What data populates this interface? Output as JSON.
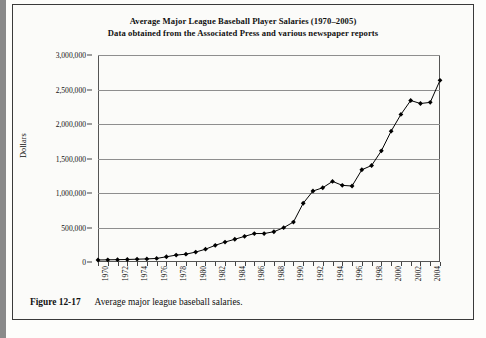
{
  "figure": {
    "caption_label": "Figure 12-17",
    "caption_text": "Average major league baseball salaries."
  },
  "chart_data": {
    "type": "line",
    "title": "Average Major League Baseball Player Salaries (1970–2005)",
    "subtitle": "Data obtained from the Associated Press and various newspaper reports",
    "xlabel": "",
    "ylabel": "Dollars",
    "ylim": [
      0,
      3000000
    ],
    "xlim": [
      1970,
      2005
    ],
    "grid": true,
    "legend": null,
    "ytick_labels": [
      "0",
      "500,000",
      "1,000,000",
      "1,500,000",
      "2,000,000",
      "2,500,000",
      "3,000,000"
    ],
    "ytick_values": [
      0,
      500000,
      1000000,
      1500000,
      2000000,
      2500000,
      3000000
    ],
    "xtick_labels": [
      "1970",
      "1972",
      "1974",
      "1976",
      "1978",
      "1980",
      "1982",
      "1984",
      "1986",
      "1988",
      "1990",
      "1992",
      "1994",
      "1996",
      "1998",
      "2000",
      "2002",
      "2004"
    ],
    "xtick_values": [
      1970,
      1972,
      1974,
      1976,
      1978,
      1980,
      1982,
      1984,
      1986,
      1988,
      1990,
      1992,
      1994,
      1996,
      1998,
      2000,
      2002,
      2004
    ],
    "marker": "diamond",
    "line_color": "#000000",
    "x": [
      1970,
      1971,
      1972,
      1973,
      1974,
      1975,
      1976,
      1977,
      1978,
      1979,
      1980,
      1981,
      1982,
      1983,
      1984,
      1985,
      1986,
      1987,
      1988,
      1989,
      1990,
      1991,
      1992,
      1993,
      1994,
      1995,
      1996,
      1997,
      1998,
      1999,
      2000,
      2001,
      2002,
      2003,
      2004,
      2005
    ],
    "values": [
      29303,
      31543,
      34092,
      36566,
      40839,
      44676,
      51501,
      76066,
      99876,
      113558,
      143756,
      185651,
      241497,
      289194,
      329408,
      371571,
      412520,
      412454,
      438729,
      497254,
      578930,
      851492,
      1028667,
      1076089,
      1168263,
      1110766,
      1101455,
      1336609,
      1398831,
      1611166,
      1895630,
      2138896,
      2340920,
      2296874,
      2313535,
      2632655
    ]
  }
}
